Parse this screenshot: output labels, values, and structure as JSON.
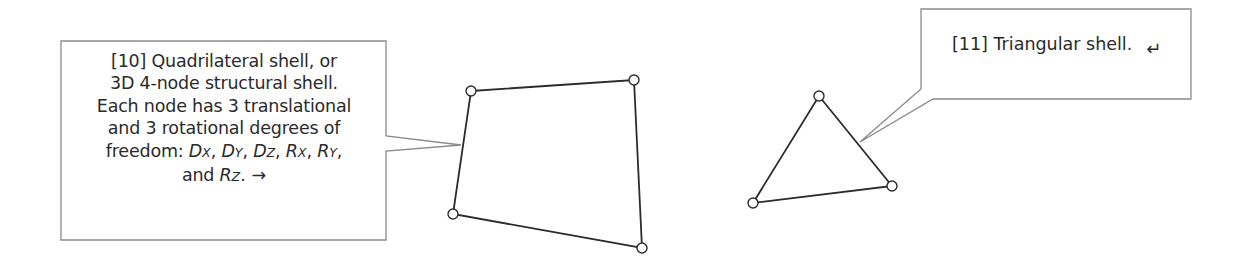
{
  "colors": {
    "background": "#ffffff",
    "box_border": "#8a8a8a",
    "pointer_line": "#8a8a8a",
    "element_edge": "#2b2b2b",
    "node_fill": "#ffffff",
    "text": "#2a2a2a"
  },
  "callouts": [
    {
      "id": "10",
      "lines": [
        "[10] Quadrilateral shell, or",
        "3D 4-node structural shell.",
        "Each node has 3 translational",
        "and 3 rotational degrees of"
      ],
      "freedom_prefix": "freedom: ",
      "dofs": [
        {
          "base": "D",
          "sub": "X",
          "sep": ", "
        },
        {
          "base": "D",
          "sub": "Y",
          "sep": ", "
        },
        {
          "base": "D",
          "sub": "Z",
          "sep": ", "
        },
        {
          "base": "R",
          "sub": "X",
          "sep": ", "
        },
        {
          "base": "R",
          "sub": "Y",
          "sep": ","
        }
      ],
      "last_line_prefix": "and ",
      "last_dof": {
        "base": "R",
        "sub": "Z",
        "sep": "."
      },
      "end_glyph": "→",
      "end_glyph_name": "arrow-right-icon",
      "box": {
        "x": 61,
        "y": 41,
        "w": 325,
        "h": 199
      },
      "pointer": {
        "base_top": [
          386,
          136
        ],
        "base_bottom": [
          386,
          151
        ],
        "tip": [
          461,
          145
        ]
      }
    },
    {
      "id": "11",
      "text": "[11] Triangular shell.",
      "end_glyph": "↵",
      "end_glyph_name": "return-arrow-icon",
      "box": {
        "x": 921,
        "y": 9,
        "w": 270,
        "h": 90
      },
      "pointer": {
        "base_top": [
          921,
          89
        ],
        "base_bottom": [
          933,
          99
        ],
        "tip": [
          860,
          142
        ]
      }
    }
  ],
  "elements": [
    {
      "name": "quadrilateral-shell",
      "nodes": [
        [
          471,
          91
        ],
        [
          634,
          80
        ],
        [
          642,
          248
        ],
        [
          453,
          214
        ]
      ]
    },
    {
      "name": "triangular-shell",
      "nodes": [
        [
          819,
          96
        ],
        [
          892,
          186
        ],
        [
          753,
          203
        ]
      ]
    }
  ]
}
